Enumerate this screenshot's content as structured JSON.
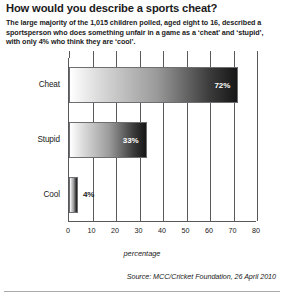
{
  "headline": "How would you describe a sports cheat?",
  "standfirst": "The large majority of the 1,015 children polled, aged eight to 16, described a sportsperson who does something unfair in a game as a ‘cheat’ and ‘stupid’, with only 4% who think they are ‘cool’.",
  "source": "Source: MCC/Cricket Foundation, 26 April 2010",
  "colors": {
    "axis": "#58595b",
    "text": "#1a1a1a",
    "bar_light": "#ffffff",
    "bar_dark": "#161616",
    "rule": "#a7a9ac"
  },
  "chart_data": {
    "type": "bar",
    "orientation": "horizontal",
    "title": "How would you describe a sports cheat?",
    "categories": [
      "Cheat",
      "Stupid",
      "Cool"
    ],
    "values": [
      72,
      33,
      4
    ],
    "value_labels": [
      "72%",
      "33%",
      "4%"
    ],
    "xlabel": "percentage",
    "ylabel": "",
    "xlim": [
      0,
      80
    ],
    "xticks": [
      0,
      10,
      20,
      30,
      40,
      50,
      60,
      70,
      80
    ],
    "xticklabels": [
      "0",
      "10",
      "20",
      "30",
      "40",
      "50",
      "60",
      "70",
      "80"
    ],
    "grid": "vertical",
    "legend": "none"
  }
}
